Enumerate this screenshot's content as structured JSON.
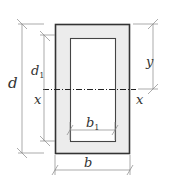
{
  "diagram": {
    "colors": {
      "outline": "#333333",
      "fill": "#ececec",
      "inner_fill": "#ffffff",
      "dimension": "#888888",
      "axis": "#222222"
    },
    "labels": {
      "d": "d",
      "d1": "d",
      "d1_sub": "1",
      "x_left": "x",
      "x_right": "x",
      "y": "y",
      "b1": "b",
      "b1_sub": "1",
      "b": "b"
    }
  }
}
